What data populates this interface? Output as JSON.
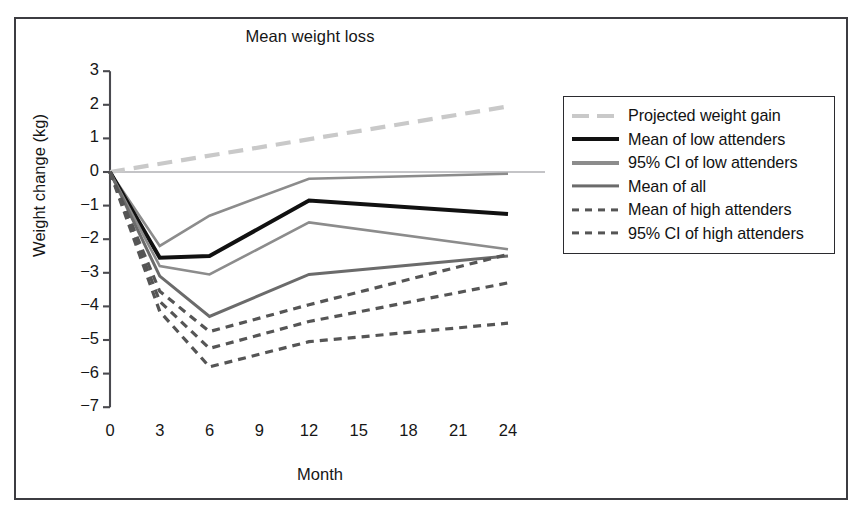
{
  "figure": {
    "title": "Mean weight loss",
    "x_axis_title": "Month",
    "y_axis_title": "Weight change (kg)"
  },
  "colors": {
    "frame": "#3c3c41",
    "axis": "#4a4a4f",
    "zero_line": "#8a8a8f",
    "projected_weight_gain": "#c9c9c9",
    "mean_low_attenders": "#111111",
    "ci_low_attenders": "#8c8c8c",
    "mean_all": "#6b6b6b",
    "mean_high_attenders": "#555555",
    "ci_high_attenders": "#555555",
    "text": "#161616"
  },
  "axes": {
    "y_ticks": [
      "3",
      "2",
      "1",
      "0",
      "−1",
      "−2",
      "−3",
      "−4",
      "−5",
      "−6",
      "−7"
    ],
    "x_ticks": [
      "0",
      "3",
      "6",
      "9",
      "12",
      "15",
      "18",
      "21",
      "24"
    ],
    "ylim": [
      -7,
      3
    ],
    "xlim": [
      0,
      24
    ]
  },
  "legend": {
    "items": [
      {
        "label": "Projected weight gain",
        "style": "dashed-long",
        "color": "#c9c9c9",
        "width": 4
      },
      {
        "label": "Mean of low attenders",
        "style": "solid",
        "color": "#111111",
        "width": 4
      },
      {
        "label": "95% CI of low attenders",
        "style": "solid",
        "color": "#8c8c8c",
        "width": 4
      },
      {
        "label": "Mean of all",
        "style": "solid",
        "color": "#6b6b6b",
        "width": 3.2
      },
      {
        "label": "Mean of high attenders",
        "style": "dotted-dash",
        "color": "#555555",
        "width": 3.2
      },
      {
        "label": "95% CI of high attenders",
        "style": "dotted-dash",
        "color": "#555555",
        "width": 3.2
      }
    ]
  },
  "chart_data": {
    "type": "line",
    "title": "Mean weight loss",
    "xlabel": "Month",
    "ylabel": "Weight change (kg)",
    "xlim": [
      0,
      24
    ],
    "ylim": [
      -7,
      3
    ],
    "grid": false,
    "legend_position": "right",
    "x": [
      0,
      3,
      6,
      12,
      24
    ],
    "series": [
      {
        "name": "Projected weight gain",
        "x": [
          0,
          24
        ],
        "values": [
          0,
          1.95
        ],
        "style": "dashed-long",
        "color": "#c9c9c9"
      },
      {
        "name": "95% CI of low attenders (upper)",
        "x": [
          0,
          3,
          6,
          12,
          24
        ],
        "values": [
          0,
          -2.2,
          -1.3,
          -0.2,
          -0.05
        ],
        "style": "solid",
        "color": "#8c8c8c"
      },
      {
        "name": "Mean of low attenders",
        "x": [
          0,
          3,
          6,
          12,
          24
        ],
        "values": [
          0,
          -2.55,
          -2.5,
          -0.85,
          -1.25
        ],
        "style": "solid",
        "color": "#111111"
      },
      {
        "name": "95% CI of low attenders (lower)",
        "x": [
          0,
          3,
          6,
          12,
          24
        ],
        "values": [
          0,
          -2.8,
          -3.05,
          -1.5,
          -2.3
        ],
        "style": "solid",
        "color": "#8c8c8c"
      },
      {
        "name": "Mean of all",
        "x": [
          0,
          3,
          6,
          12,
          24
        ],
        "values": [
          0,
          -3.1,
          -4.3,
          -3.05,
          -2.5
        ],
        "style": "solid",
        "color": "#6b6b6b"
      },
      {
        "name": "Mean of high attenders",
        "x": [
          0,
          3,
          6,
          12,
          24
        ],
        "values": [
          0,
          -3.55,
          -4.75,
          -3.95,
          -2.45
        ],
        "style": "dotted-dash",
        "color": "#555555"
      },
      {
        "name": "95% CI of high attenders (upper)",
        "x": [
          0,
          3,
          6,
          12,
          24
        ],
        "values": [
          0,
          -3.85,
          -5.25,
          -4.45,
          -3.3
        ],
        "style": "dotted-dash",
        "color": "#555555"
      },
      {
        "name": "95% CI of high attenders (lower)",
        "x": [
          0,
          3,
          6,
          12,
          24
        ],
        "values": [
          0,
          -4.15,
          -5.8,
          -5.05,
          -4.5
        ],
        "style": "dotted-dash",
        "color": "#555555"
      }
    ]
  }
}
